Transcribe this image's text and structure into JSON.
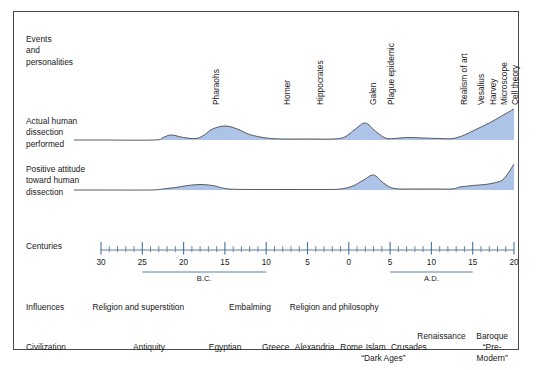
{
  "figure": {
    "row_labels": {
      "events": "Events\nand\npersonalities",
      "actual": "Actual human\ndissection\nperformed",
      "positive": "Positive attitude\ntoward human\ndissection",
      "centuries": "Centuries",
      "influences": "Influences",
      "civilization": "Civilization"
    }
  },
  "chart_data": {
    "type": "area",
    "title": "Events and personalities",
    "xlabel": "Centuries",
    "xlim": [
      -30,
      20
    ],
    "axis": {
      "major_ticks": [
        -30,
        -25,
        -20,
        -15,
        -10,
        -5,
        0,
        5,
        10,
        15,
        20
      ],
      "major_tick_labels": [
        "30",
        "25",
        "20",
        "15",
        "10",
        "5",
        "0",
        "5",
        "10",
        "15",
        "20"
      ],
      "minor_tick_step": 1,
      "grid": false,
      "eras": [
        {
          "label": "B.C.",
          "start": -25,
          "end": -10
        },
        {
          "label": "A.D.",
          "start": 5,
          "end": 15
        }
      ]
    },
    "annotations": [
      {
        "label": "Pharaohs",
        "x": -17
      },
      {
        "label": "Homer",
        "x": -8.5
      },
      {
        "label": "Hippocrates",
        "x": -4.5
      },
      {
        "label": "Galen",
        "x": 2
      },
      {
        "label": "Plague epidemic",
        "x": 4.2
      },
      {
        "label": "Realism of art",
        "x": 13
      },
      {
        "label": "Vesalius",
        "x": 15
      },
      {
        "label": "Harvey",
        "x": 16.5
      },
      {
        "label": "Microscope",
        "x": 17.8
      },
      {
        "label": "Cell theory",
        "x": 19.2
      }
    ],
    "series": [
      {
        "name": "Actual human dissection performed",
        "x": [
          -30,
          -23.5,
          -22.5,
          -21.5,
          -20,
          -18.5,
          -17.5,
          -16.5,
          -15,
          -13.5,
          -12,
          -10,
          -8,
          -5,
          -2,
          -0.5,
          0.8,
          2,
          3.2,
          4.4,
          5.5,
          7,
          9,
          11,
          12.6,
          14,
          15.5,
          17,
          18.5,
          20
        ],
        "y": [
          0,
          0,
          2.5,
          5,
          2.5,
          1.5,
          5,
          11,
          14,
          11,
          5.5,
          2,
          1,
          1,
          1,
          3,
          11,
          17,
          9,
          2,
          1.5,
          2.5,
          2,
          1.5,
          1.5,
          5,
          11,
          17,
          24,
          31
        ]
      },
      {
        "name": "Positive attitude toward human dissection",
        "x": [
          -30,
          -24,
          -22.5,
          -21,
          -19.5,
          -18,
          -16.5,
          -15.5,
          -14.5,
          -12,
          -9,
          -6,
          -3,
          -1,
          0.5,
          1.8,
          3,
          4.2,
          5.5,
          8,
          10.5,
          12.5,
          13.5,
          15,
          16.5,
          17.8,
          18.6,
          19.3,
          20
        ],
        "y": [
          0,
          0,
          1,
          2.5,
          4.5,
          5.5,
          4.5,
          2.5,
          1,
          0.5,
          0.5,
          0.5,
          0.5,
          1,
          4,
          10,
          15,
          7,
          1.5,
          1,
          1,
          1,
          3,
          4.5,
          5.5,
          7.5,
          10,
          17,
          26
        ]
      }
    ]
  },
  "influences": [
    {
      "label": "Religion and superstition",
      "x": 0.155
    },
    {
      "label": "Embalming",
      "x": 0.425
    },
    {
      "label": "Religion and philosophy",
      "x": 0.545
    }
  ],
  "civilization": {
    "main": [
      {
        "label": "Antiquity",
        "x": 0.235
      },
      {
        "label": "Egyptian",
        "x": 0.385
      },
      {
        "label": "Greece",
        "x": 0.49
      },
      {
        "label": "Alexandria",
        "x": 0.555
      },
      {
        "label": "Rome",
        "x": 0.645
      },
      {
        "label": "Islam",
        "x": 0.695
      },
      {
        "label": "Crusades",
        "x": 0.745
      }
    ],
    "stacked": [
      {
        "lines": [
          "Renaissance"
        ],
        "x": 0.845,
        "row": "top"
      },
      {
        "lines": [
          "Baroque",
          "“Pre-",
          "Modern”"
        ],
        "x": 0.945,
        "row": "top"
      },
      {
        "lines": [
          "“Dark Ages”"
        ],
        "x": 0.73,
        "row": "bottom"
      }
    ]
  },
  "colors": {
    "fill": "#aec3e8",
    "curve_line": "#4a4a4a",
    "axis": "#4a6f9e",
    "border": "#4a4a4a",
    "text": "#202020"
  }
}
